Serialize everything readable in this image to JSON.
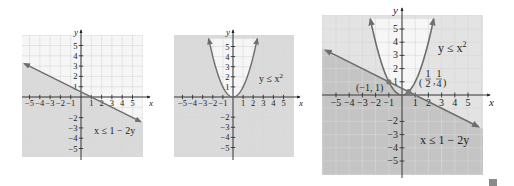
{
  "chart_data": [
    {
      "type": "region",
      "title": "",
      "inequality": "x ≤ 1 − 2y",
      "xlabel": "x",
      "ylabel": "y",
      "xlim": [
        -5.7,
        6
      ],
      "ylim": [
        -5.8,
        6
      ],
      "x_ticks": [
        -5,
        -4,
        -3,
        -2,
        -1,
        1,
        2,
        3,
        4,
        5
      ],
      "y_ticks": [
        5,
        4,
        3,
        2,
        1,
        -2,
        -3,
        -4,
        -5
      ],
      "x_tick_labels": [
        "−5",
        "−4",
        "−3",
        "−2",
        "−1",
        "1",
        "2",
        "3",
        "4",
        "5"
      ],
      "y_tick_labels": [
        "5",
        "4",
        "3",
        "2",
        "1",
        "−2",
        "−3",
        "−4",
        "−5"
      ],
      "boundary": {
        "kind": "line",
        "equation": "y = (1 - x)/2",
        "points": [
          [
            -5.5,
            3.25
          ],
          [
            5.8,
            -2.4
          ]
        ]
      },
      "shaded": "below line",
      "grid": true
    },
    {
      "type": "region",
      "title": "",
      "inequality": "y ≤ x²",
      "xlabel": "x",
      "ylabel": "y",
      "xlim": [
        -5.9,
        6
      ],
      "ylim": [
        -5.8,
        6
      ],
      "x_ticks": [
        -5,
        -4,
        -3,
        -2,
        -1,
        1,
        2,
        3,
        4,
        5
      ],
      "y_ticks": [
        5,
        4,
        3,
        2,
        1,
        -2,
        -3,
        -4,
        -5
      ],
      "x_tick_labels": [
        "−5",
        "−4",
        "−3",
        "−2",
        "−1",
        "1",
        "2",
        "3",
        "4",
        "5"
      ],
      "y_tick_labels": [
        "5",
        "4",
        "3",
        "2",
        "1",
        "−2",
        "−3",
        "−4",
        "−5"
      ],
      "boundary": {
        "kind": "parabola",
        "equation": "y = x^2",
        "x_range": [
          -2.4,
          2.4
        ]
      },
      "shaded": "outside parabola (below curve)",
      "grid": true
    },
    {
      "type": "region",
      "title": "",
      "inequalities": [
        "y ≤ x²",
        "x ≤ 1 − 2y"
      ],
      "xlabel": "x",
      "ylabel": "y",
      "xlim": [
        -6,
        6.2
      ],
      "ylim": [
        -6,
        6
      ],
      "x_ticks": [
        -5,
        -4,
        -3,
        -2,
        -1,
        1,
        2,
        3,
        4,
        5
      ],
      "y_ticks": [
        5,
        4,
        3,
        2,
        1,
        -2,
        -3,
        -4,
        -5
      ],
      "x_tick_labels": [
        "−5",
        "−4",
        "−3",
        "−2",
        "−1",
        "1",
        "2",
        "3",
        "4",
        "5"
      ],
      "y_tick_labels": [
        "5",
        "4",
        "3",
        "2",
        "1",
        "−2",
        "−3",
        "−4",
        "−5"
      ],
      "boundaries": [
        {
          "kind": "parabola",
          "equation": "y = x^2",
          "x_range": [
            -2.4,
            2.4
          ]
        },
        {
          "kind": "line",
          "equation": "y = (1 - x)/2",
          "points": [
            [
              -5.8,
              3.4
            ],
            [
              5.8,
              -2.4
            ]
          ]
        }
      ],
      "intersection_points": [
        {
          "x": -1,
          "y": 1,
          "label": "(−1, 1)"
        },
        {
          "x": 0.5,
          "y": 0.25,
          "label": "(1/2, 1/4)"
        }
      ],
      "shaded": "overlap darkest",
      "grid": true
    }
  ],
  "labels": {
    "graph1_ineq": "x ≤ 1 − 2y",
    "graph2_ineq_base": "y ≤ x",
    "graph2_ineq_exp": "2",
    "graph3_ineq_top_base": "y ≤ x",
    "graph3_ineq_top_exp": "2",
    "graph3_ineq_bottom": "x ≤ 1 − 2y",
    "point1": "(−1, 1)",
    "point2_num1": "1",
    "point2_den1": "2",
    "point2_num2": "1",
    "point2_den2": "4",
    "x_axis": "x",
    "y_axis": "y"
  },
  "colors": {
    "background": "#f6f6f6",
    "grid": "#d6d6d6",
    "shade": "#dadada",
    "shade_dark": "#c4c4c4",
    "curve": "#6d6d6d",
    "axis": "#222222"
  }
}
